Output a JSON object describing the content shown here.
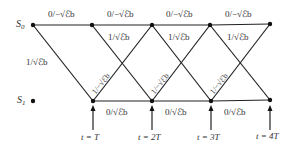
{
  "trellis": {
    "states": [
      {
        "name": "S",
        "sub": "0"
      },
      {
        "name": "S",
        "sub": "1"
      }
    ],
    "top_branch_label": "0/−√ℰb",
    "down_branch_label": "1/√ℰb",
    "up_branch_label": "1/−√ℰb",
    "bottom_branch_label": "0/√ℰb",
    "top_labels": [
      "0/−√ℰb",
      "0/−√ℰb",
      "0/−√ℰb",
      "0/−√ℰb"
    ],
    "down_labels": [
      "1/√ℰb",
      "1/√ℰb",
      "1/√ℰb",
      "1/√ℰb"
    ],
    "up_labels": [
      "1/−√ℰb",
      "1/−√ℰb",
      "1/−√ℰb"
    ],
    "bottom_labels": [
      "0/√ℰb",
      "0/√ℰb",
      "0/√ℰb"
    ],
    "time_labels": [
      "t = T",
      "t = 2T",
      "t = 3T",
      "t = 4T"
    ]
  },
  "colors": {
    "line": "#222222",
    "text": "#333333"
  }
}
